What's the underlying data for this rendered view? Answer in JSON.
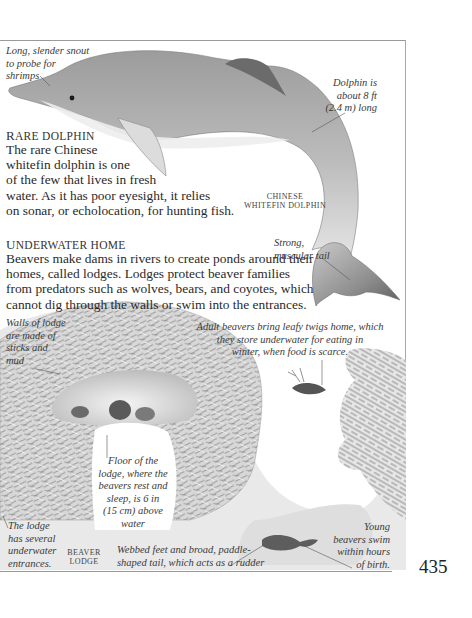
{
  "page": {
    "number": "435"
  },
  "dolphin_section": {
    "heading_first": "R",
    "heading_rest": "ARE DOLPHIN",
    "body_lines": [
      "The rare Chinese",
      "whitefin dolphin is one",
      "of the few that lives in fresh",
      "water. As it has poor eyesight, it relies",
      "on sonar, or echolocation, for hunting fish."
    ],
    "illustration_label_line1": "Chinese",
    "illustration_label_line2": "whitefin dolphin",
    "callouts": {
      "snout": [
        "Long, slender snout",
        "to probe for",
        "shrimps"
      ],
      "length": [
        "Dolphin is",
        "about 8 ft",
        "(2.4 m) long"
      ],
      "tail": [
        "Strong,",
        "muscular tail"
      ]
    }
  },
  "beaver_section": {
    "heading_first": "U",
    "heading_rest": "NDERWATER HOME",
    "body_lines": [
      "Beavers make dams in rivers to create ponds around their",
      "homes, called lodges. Lodges protect beaver families",
      "from predators such as wolves, bears, and coyotes, which",
      "cannot dig through the walls or swim into the entrances."
    ],
    "illustration_label_line1": "Beaver",
    "illustration_label_line2": "lodge",
    "callouts": {
      "walls": [
        "Walls of lodge",
        "are made of",
        "sticks and",
        "mud"
      ],
      "twigs": [
        "Adult beavers bring leafy twigs home, which",
        "they store underwater for eating in",
        "winter, when food is scarce."
      ],
      "floor": [
        "Floor of the",
        "lodge, where the",
        "beavers rest and",
        "sleep, is 6 in",
        "(15 cm) above",
        "water"
      ],
      "entrances": [
        "The lodge",
        "has several",
        "underwater",
        "entrances."
      ],
      "feet": [
        "Webbed feet and broad, paddle-",
        "shaped tail, which acts as a rudder"
      ],
      "young": [
        "Young",
        "beavers swim",
        "within hours",
        "of birth."
      ]
    }
  },
  "colors": {
    "ink": "#2a2a2a",
    "rule": "#9a9a9a",
    "dolphin_body": "#b9b9b9",
    "dolphin_dark": "#6e6e6e"
  }
}
